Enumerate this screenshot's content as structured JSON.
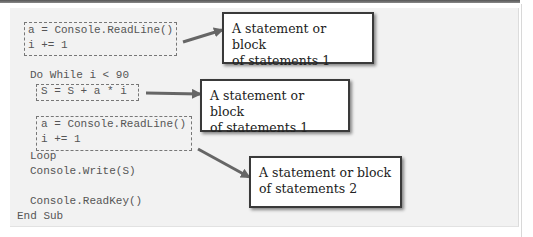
{
  "code": {
    "block1": [
      "a = Console.ReadLine()",
      "i += 1"
    ],
    "do_while": "Do While i < 90",
    "block2": [
      "S = S + a * i"
    ],
    "block3": [
      "a = Console.ReadLine()",
      "i += 1"
    ],
    "loop": "Loop",
    "write": "Console.Write(S)",
    "readkey": "Console.ReadKey()",
    "end_sub": "End Sub"
  },
  "callouts": [
    {
      "line1": "A statement or block",
      "line2": "of statements 1"
    },
    {
      "line1": "A statement or block",
      "line2": "of statements 1"
    },
    {
      "line1": "A statement or block",
      "line2": "of statements 2"
    }
  ],
  "colors": {
    "panel": "#f2f2f2",
    "code_text": "#555555",
    "callout_border": "#3a3a3a",
    "arrow": "#666666"
  }
}
